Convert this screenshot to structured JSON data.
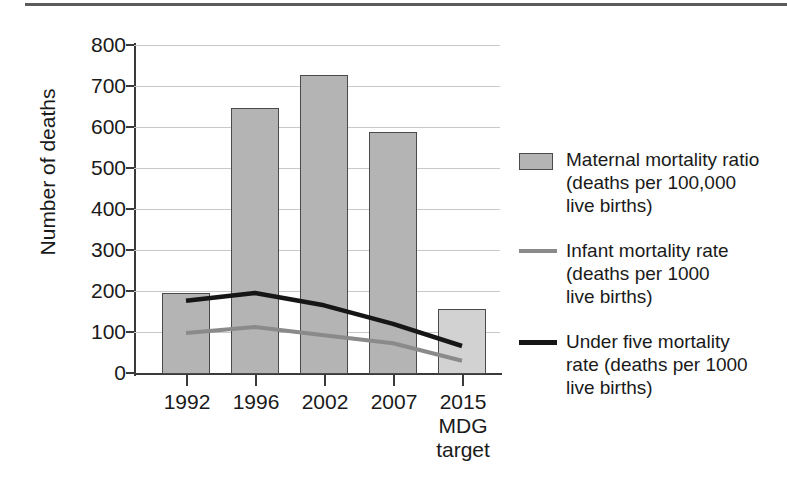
{
  "chart_data": {
    "type": "bar",
    "title": "",
    "xlabel": "",
    "ylabel": "Number of deaths",
    "ylim": [
      0,
      800
    ],
    "y_ticks": [
      0,
      100,
      200,
      300,
      400,
      500,
      600,
      700,
      800
    ],
    "categories": [
      "1992",
      "1996",
      "2002",
      "2007",
      "2015\nMDG\ntarget"
    ],
    "category_labels": [
      {
        "line1": "1992",
        "line2": "",
        "line3": ""
      },
      {
        "line1": "1996",
        "line2": "",
        "line3": ""
      },
      {
        "line1": "2002",
        "line2": "",
        "line3": ""
      },
      {
        "line1": "2007",
        "line2": "",
        "line3": ""
      },
      {
        "line1": "2015",
        "line2": "MDG",
        "line3": "target"
      }
    ],
    "grid": true,
    "legend_position": "right",
    "series": [
      {
        "name": "Maternal mortality ratio (deaths per 100,000 live births)",
        "type": "bar",
        "values": [
          197,
          646,
          728,
          589,
          158
        ],
        "color": "#b4b4b4",
        "last_bar_color": "#d2d2d2"
      },
      {
        "name": "Infant mortality rate (deaths per 1000 live births)",
        "type": "line",
        "values": [
          100,
          114,
          94,
          75,
          32
        ],
        "color": "#8a8a8a"
      },
      {
        "name": "Under five mortality rate (deaths per 1000 live births)",
        "type": "line",
        "values": [
          178,
          197,
          167,
          122,
          68
        ],
        "color": "#161616"
      }
    ]
  },
  "axes": {
    "y_title": "Number of deaths",
    "y_tick_labels": [
      "800",
      "700",
      "600",
      "500",
      "400",
      "300",
      "200",
      "100",
      "0"
    ],
    "x_tick_labels": [
      "1992",
      "1996",
      "2002",
      "2007",
      "2015"
    ],
    "x_sublabels_2015": [
      "MDG",
      "target"
    ]
  },
  "legend": {
    "entries": [
      {
        "marker": "filled-square-swatch",
        "label": "Maternal mortality ratio\n(deaths per 100,000\nlive births)"
      },
      {
        "marker": "gray-line-swatch",
        "label": "Infant mortality rate\n(deaths per 1000\nlive births)"
      },
      {
        "marker": "black-line-swatch",
        "label": "Under five mortality\nrate (deaths per 1000\nlive births)"
      }
    ]
  }
}
